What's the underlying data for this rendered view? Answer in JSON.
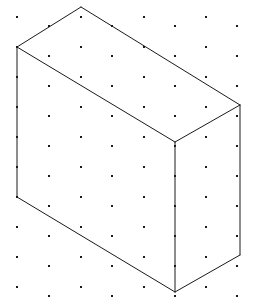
{
  "figure": {
    "canvas": {
      "width": 253,
      "height": 308,
      "background_color": "#ffffff"
    },
    "style": {
      "line_color": "#1a1a1a",
      "line_width": 1,
      "face_fill": "#ffffff",
      "dot_color": "#1a1a1a",
      "dot_size": 2.4
    },
    "grid": {
      "type": "isometric-dot-lattice",
      "horizontal_spacing": 63,
      "vertical_spacing": 30,
      "row_stagger_x": 31.5,
      "row_stagger_y": 15,
      "origin_x": 17,
      "origin_y": 17,
      "columns": 4,
      "rows": 20,
      "dots": [
        [
          17,
          17
        ],
        [
          81,
          17
        ],
        [
          144,
          17
        ],
        [
          206,
          17
        ],
        [
          49,
          26
        ],
        [
          112,
          26
        ],
        [
          175,
          26
        ],
        [
          237,
          26
        ],
        [
          17,
          47
        ],
        [
          81,
          47
        ],
        [
          144,
          47
        ],
        [
          206,
          47
        ],
        [
          49,
          56
        ],
        [
          112,
          56
        ],
        [
          175,
          56
        ],
        [
          237,
          56
        ],
        [
          17,
          77
        ],
        [
          81,
          77
        ],
        [
          144,
          77
        ],
        [
          206,
          77
        ],
        [
          49,
          86
        ],
        [
          112,
          86
        ],
        [
          175,
          86
        ],
        [
          237,
          86
        ],
        [
          17,
          107
        ],
        [
          81,
          107
        ],
        [
          144,
          107
        ],
        [
          206,
          107
        ],
        [
          49,
          116
        ],
        [
          112,
          116
        ],
        [
          175,
          116
        ],
        [
          237,
          116
        ],
        [
          17,
          137
        ],
        [
          81,
          137
        ],
        [
          144,
          137
        ],
        [
          206,
          137
        ],
        [
          49,
          146
        ],
        [
          112,
          146
        ],
        [
          175,
          146
        ],
        [
          237,
          146
        ],
        [
          17,
          167
        ],
        [
          81,
          167
        ],
        [
          144,
          167
        ],
        [
          206,
          167
        ],
        [
          49,
          176
        ],
        [
          112,
          176
        ],
        [
          175,
          176
        ],
        [
          237,
          176
        ],
        [
          17,
          197
        ],
        [
          81,
          197
        ],
        [
          144,
          197
        ],
        [
          206,
          197
        ],
        [
          49,
          206
        ],
        [
          112,
          206
        ],
        [
          175,
          206
        ],
        [
          237,
          206
        ],
        [
          17,
          227
        ],
        [
          81,
          227
        ],
        [
          144,
          227
        ],
        [
          206,
          227
        ],
        [
          49,
          236
        ],
        [
          112,
          236
        ],
        [
          175,
          236
        ],
        [
          237,
          236
        ],
        [
          17,
          257
        ],
        [
          81,
          257
        ],
        [
          144,
          257
        ],
        [
          206,
          257
        ],
        [
          49,
          266
        ],
        [
          112,
          266
        ],
        [
          175,
          266
        ],
        [
          237,
          266
        ],
        [
          17,
          287
        ],
        [
          81,
          287
        ],
        [
          144,
          287
        ],
        [
          206,
          287
        ],
        [
          49,
          296
        ],
        [
          112,
          296
        ],
        [
          175,
          296
        ],
        [
          237,
          296
        ]
      ]
    },
    "solid": {
      "shape": "cuboid",
      "projection": "isometric",
      "vertices": {
        "top_back": [
          81,
          7
        ],
        "top_left": [
          17,
          47
        ],
        "top_right": [
          240,
          105
        ],
        "top_front": [
          175,
          142
        ],
        "bottom_left": [
          17,
          197
        ],
        "bottom_right": [
          240,
          255
        ],
        "bottom_front": [
          175,
          292
        ]
      },
      "faces": [
        {
          "name": "top-face",
          "points": "81,7 17,47 175,142 240,105"
        },
        {
          "name": "left-front-face",
          "points": "17,47 17,197 175,292 175,142"
        },
        {
          "name": "right-side-face",
          "points": "175,142 175,292 240,255 240,105"
        }
      ],
      "edges": [
        {
          "name": "top-back-left-edge",
          "points": "81,7 17,47"
        },
        {
          "name": "top-back-right-edge",
          "points": "81,7 240,105"
        },
        {
          "name": "top-front-left-edge",
          "points": "17,47 175,142"
        },
        {
          "name": "top-front-right-edge",
          "points": "175,142 240,105"
        },
        {
          "name": "left-vertical-edge",
          "points": "17,47 17,197"
        },
        {
          "name": "front-vertical-edge",
          "points": "175,142 175,292"
        },
        {
          "name": "right-vertical-edge",
          "points": "240,105 240,255"
        },
        {
          "name": "bottom-front-left-edge",
          "points": "17,197 175,292"
        },
        {
          "name": "bottom-front-right-edge",
          "points": "175,292 240,255"
        }
      ]
    }
  }
}
